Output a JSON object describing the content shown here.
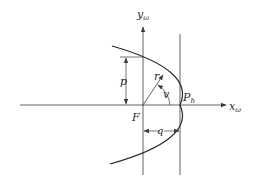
{
  "diagram": {
    "colors": {
      "background": "#ffffff",
      "stroke": "#3a3a3a",
      "text": "#2a2a2a"
    },
    "labels": {
      "x_axis": "x",
      "x_axis_sub": "ω",
      "y_axis": "y",
      "y_axis_sub": "ω",
      "focus": "F",
      "periapsis": "P",
      "periapsis_sub": "h",
      "semi_latus_rectum": "p",
      "radius": "r",
      "true_anomaly": "v",
      "periapsis_distance": "q"
    },
    "elements": [
      {
        "type": "axis",
        "name": "x-axis",
        "label": "xω"
      },
      {
        "type": "axis",
        "name": "y-axis",
        "label": "yω"
      },
      {
        "type": "curve",
        "name": "parabola",
        "opens": "left"
      },
      {
        "type": "line",
        "name": "vertical-through-periapsis"
      },
      {
        "type": "dimension",
        "name": "p",
        "from": "F",
        "to": "parabola at y-axis"
      },
      {
        "type": "vector",
        "name": "r",
        "from": "F",
        "to": "parabola"
      },
      {
        "type": "angle",
        "name": "v",
        "between": "x-axis and r"
      },
      {
        "type": "dimension",
        "name": "q",
        "from": "F",
        "to": "P_h"
      }
    ]
  }
}
